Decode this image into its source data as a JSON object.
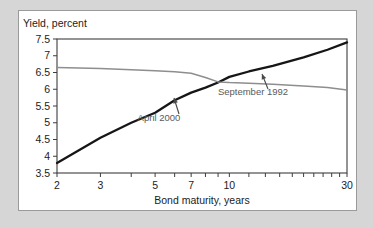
{
  "figure": {
    "background_color": "#d6d6d6",
    "panel_color": "#ffffff",
    "panel_border_color": "#9a9a9a"
  },
  "chart_data": {
    "type": "line",
    "title": "",
    "xlabel": "Bond maturity, years",
    "ylabel": "Yield, percent",
    "xscale": "log",
    "xlim": [
      2,
      30
    ],
    "ylim": [
      3.5,
      7.5
    ],
    "grid": false,
    "legend_position": "inline-annotations",
    "x_tick_labels": [
      "2",
      "3",
      "5",
      "7",
      "10",
      "30"
    ],
    "x_tick_values": [
      2,
      3,
      5,
      7,
      10,
      30
    ],
    "x_minor_ticks": [
      2,
      3,
      4,
      5,
      6,
      7,
      8,
      9,
      10,
      12,
      14,
      16,
      18,
      20,
      22,
      24,
      26,
      28,
      30
    ],
    "y_tick_labels": [
      "7.5",
      "7",
      "6.5",
      "6",
      "5.5",
      "5",
      "4.5",
      "4",
      "3.5"
    ],
    "y_tick_values": [
      7.5,
      7,
      6.5,
      6,
      5.5,
      5,
      4.5,
      4,
      3.5
    ],
    "series": [
      {
        "name": "September 1992",
        "color": "#161616",
        "width": 2.3,
        "x": [
          2,
          3,
          4,
          5,
          6,
          7,
          8,
          9,
          10,
          12,
          15,
          20,
          25,
          30
        ],
        "values": [
          3.8,
          4.55,
          5.0,
          5.3,
          5.67,
          5.9,
          6.05,
          6.2,
          6.37,
          6.53,
          6.7,
          6.95,
          7.18,
          7.4
        ]
      },
      {
        "name": "April 2000",
        "color": "#8e8e8e",
        "width": 1.5,
        "x": [
          2,
          3,
          4,
          5,
          6,
          7,
          8,
          9,
          10,
          12,
          15,
          20,
          25,
          30
        ],
        "values": [
          6.65,
          6.62,
          6.58,
          6.55,
          6.52,
          6.48,
          6.35,
          6.22,
          6.2,
          6.18,
          6.15,
          6.1,
          6.05,
          5.98
        ]
      }
    ],
    "annotations": [
      {
        "text": "September 1992",
        "target_series": "September 1992",
        "label_x": 234,
        "label_y": 84,
        "arrow_from_x": 249,
        "arrow_from_y": 78,
        "arrow_to_x": 243,
        "arrow_to_y": 63
      },
      {
        "text": "April 2000",
        "target_series": "April 2000",
        "label_x": 140,
        "label_y": 110,
        "arrow_from_x": 160,
        "arrow_from_y": 103,
        "arrow_to_x": 155,
        "arrow_to_y": 87
      }
    ]
  }
}
